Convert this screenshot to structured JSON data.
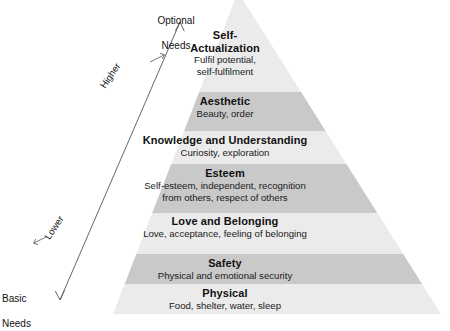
{
  "diagram": {
    "kind": "pyramid-hierarchy",
    "background_color": "#ffffff",
    "text_color": "#111111",
    "band_light_color": "#ebebeb",
    "band_dark_color": "#c9c9c9",
    "arrow_color": "#555555",
    "tiers": [
      {
        "id": "self-actualization",
        "title": "Self-",
        "title_line2": "Actualization",
        "desc_line1": "Fulfil potential,",
        "desc_line2": "self-fulfilment",
        "shade": "light"
      },
      {
        "id": "aesthetic",
        "title": "Aesthetic",
        "desc_line1": "Beauty, order",
        "shade": "dark"
      },
      {
        "id": "knowledge",
        "title": "Knowledge and Understanding",
        "desc_line1": "Curiosity, exploration",
        "shade": "light"
      },
      {
        "id": "esteem",
        "title": "Esteem",
        "desc_line1": "Self-esteem, independent, recognition",
        "desc_line2": "from others, respect of others",
        "shade": "dark"
      },
      {
        "id": "love-and-belonging",
        "title": "Love and Belonging",
        "desc_line1": "Love, acceptance, feeling of belonging",
        "shade": "light"
      },
      {
        "id": "safety",
        "title": "Safety",
        "desc_line1": "Physical and emotional security",
        "shade": "dark"
      },
      {
        "id": "physical",
        "title": "Physical",
        "desc_line1": "Food, shelter, water, sleep",
        "shade": "light"
      }
    ],
    "axis": {
      "top_label_line1": "Optional",
      "top_label_line2": "Needs",
      "bottom_label_line1": "Basic",
      "bottom_label_line2": "Needs",
      "upper_direction_label": "Higher",
      "lower_direction_label": "Lower"
    }
  }
}
